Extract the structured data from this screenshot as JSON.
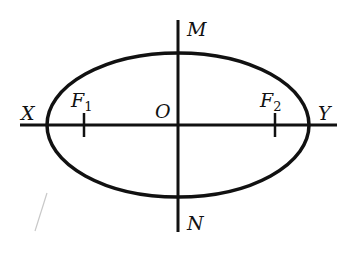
{
  "diagram": {
    "type": "ellipse-with-axes",
    "colors": {
      "stroke": "#111111",
      "background": "#ffffff",
      "scan_mark": "#c8c8c8"
    },
    "ellipse": {
      "center": [
        178,
        125
      ],
      "rx": 131,
      "ry": 72,
      "stroke_width": 3.5
    },
    "axes": {
      "horizontal": {
        "x1": 20,
        "x2": 337,
        "y": 125
      },
      "vertical": {
        "x": 178,
        "y1": 20,
        "y2": 232
      }
    },
    "foci": [
      {
        "name": "F",
        "subscript": "1",
        "x": 84,
        "y": 125
      },
      {
        "name": "F",
        "subscript": "2",
        "x": 275,
        "y": 125
      }
    ],
    "labels": {
      "X": "X",
      "Y": "Y",
      "M": "M",
      "N": "N",
      "O": "O",
      "F1_main": "F",
      "F1_sub": "1",
      "F2_main": "F",
      "F2_sub": "2"
    }
  }
}
